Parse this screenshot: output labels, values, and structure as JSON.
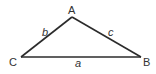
{
  "diagram": {
    "type": "triangle",
    "stroke_color": "#2b2b2b",
    "vertices": [
      {
        "id": "A",
        "label": "A",
        "x": 72,
        "y": 17
      },
      {
        "id": "B",
        "label": "B",
        "x": 141,
        "y": 57
      },
      {
        "id": "C",
        "label": "C",
        "x": 21,
        "y": 57
      }
    ],
    "sides": [
      {
        "id": "a",
        "label": "a",
        "between": [
          "C",
          "B"
        ]
      },
      {
        "id": "b",
        "label": "b",
        "between": [
          "C",
          "A"
        ]
      },
      {
        "id": "c",
        "label": "c",
        "between": [
          "A",
          "B"
        ]
      }
    ]
  }
}
